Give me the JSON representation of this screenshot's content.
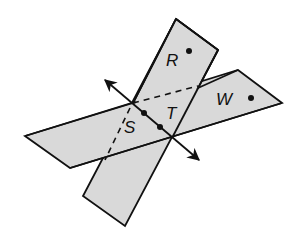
{
  "diagram": {
    "type": "two intersecting planes with line of intersection",
    "labels": {
      "plane_vertical_point": "R",
      "plane_horizontal_point": "W",
      "line_point_1": "S",
      "line_point_2": "T"
    },
    "colors": {
      "plane_fill": "#d9d9d9",
      "stroke": "#111111",
      "background": "#ffffff"
    }
  }
}
